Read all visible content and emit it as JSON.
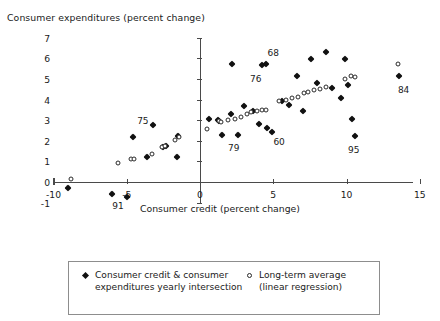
{
  "chart_data": {
    "type": "scatter",
    "title": "Consumer expenditures (percent change)",
    "xlabel": "Consumer credit (percent change)",
    "ylabel": "Consumer expenditures (percent change)",
    "xlim": [
      -10,
      15
    ],
    "ylim": [
      -1,
      7
    ],
    "xticks": [
      -10,
      -5,
      0,
      5,
      10,
      15
    ],
    "xtick_labels": [
      "-10",
      "-5",
      "0",
      "5",
      "10",
      "15"
    ],
    "yticks": [
      -1,
      0,
      1,
      2,
      3,
      4,
      5,
      6,
      7
    ],
    "ytick_labels": [
      "-1",
      "0",
      "1",
      "2",
      "3",
      "4",
      "5",
      "6",
      "7"
    ],
    "grid": false,
    "legend_position": "bottom",
    "series": [
      {
        "name": "Consumer credit & consumer expenditures yearly intersection",
        "marker": "filled-diamond",
        "color": "#111111",
        "points": [
          [
            -9.0,
            -0.3
          ],
          [
            -6.0,
            -0.6
          ],
          [
            -5.0,
            -0.75
          ],
          [
            -4.6,
            2.2
          ],
          [
            -3.2,
            2.75
          ],
          [
            -3.6,
            1.2
          ],
          [
            -2.5,
            1.7
          ],
          [
            -2.3,
            1.75
          ],
          [
            -1.5,
            2.25
          ],
          [
            -1.6,
            1.2
          ],
          [
            0.6,
            3.05
          ],
          [
            1.2,
            3.0
          ],
          [
            1.3,
            2.95
          ],
          [
            1.5,
            2.3
          ],
          [
            2.1,
            3.3
          ],
          [
            2.2,
            5.75
          ],
          [
            2.6,
            2.3
          ],
          [
            3.0,
            3.7
          ],
          [
            3.6,
            3.45
          ],
          [
            4.2,
            5.7
          ],
          [
            4.5,
            5.75
          ],
          [
            4.0,
            2.8
          ],
          [
            4.6,
            2.6
          ],
          [
            4.9,
            2.45
          ],
          [
            5.6,
            3.95
          ],
          [
            6.1,
            3.75
          ],
          [
            6.6,
            5.15
          ],
          [
            7.0,
            3.45
          ],
          [
            7.6,
            5.95
          ],
          [
            8.0,
            4.8
          ],
          [
            8.6,
            6.3
          ],
          [
            9.0,
            4.55
          ],
          [
            9.6,
            4.1
          ],
          [
            9.9,
            5.95
          ],
          [
            10.1,
            4.7
          ],
          [
            10.4,
            3.05
          ],
          [
            10.6,
            2.25
          ],
          [
            13.6,
            5.15
          ]
        ]
      },
      {
        "name": "Long-term average (linear regression)",
        "marker": "open-circle",
        "color": "#2a2a2a",
        "points": [
          [
            -8.8,
            0.15
          ],
          [
            -5.6,
            0.9
          ],
          [
            -4.7,
            1.1
          ],
          [
            -4.5,
            1.1
          ],
          [
            -3.3,
            1.35
          ],
          [
            -2.6,
            1.7
          ],
          [
            -2.4,
            1.75
          ],
          [
            -1.7,
            2.05
          ],
          [
            -1.4,
            2.2
          ],
          [
            0.5,
            2.55
          ],
          [
            1.3,
            2.95
          ],
          [
            1.4,
            2.9
          ],
          [
            1.9,
            3.0
          ],
          [
            2.4,
            3.05
          ],
          [
            2.8,
            3.15
          ],
          [
            3.2,
            3.3
          ],
          [
            3.5,
            3.4
          ],
          [
            3.9,
            3.45
          ],
          [
            4.2,
            3.5
          ],
          [
            4.5,
            3.5
          ],
          [
            5.4,
            3.95
          ],
          [
            5.9,
            4.0
          ],
          [
            6.3,
            4.1
          ],
          [
            6.7,
            4.15
          ],
          [
            7.1,
            4.3
          ],
          [
            7.4,
            4.35
          ],
          [
            7.8,
            4.45
          ],
          [
            8.2,
            4.5
          ],
          [
            8.6,
            4.6
          ],
          [
            9.9,
            5.0
          ],
          [
            10.3,
            5.15
          ],
          [
            10.6,
            5.1
          ],
          [
            13.5,
            5.75
          ]
        ]
      }
    ],
    "annotations": [
      {
        "text": "75",
        "x": -3.9,
        "y": 2.95
      },
      {
        "text": "91",
        "x": -5.6,
        "y": -1.15
      },
      {
        "text": "79",
        "x": 2.3,
        "y": 1.65
      },
      {
        "text": "60",
        "x": 5.4,
        "y": 1.95
      },
      {
        "text": "68",
        "x": 5.0,
        "y": 6.25
      },
      {
        "text": "76",
        "x": 3.8,
        "y": 5.0
      },
      {
        "text": "95",
        "x": 10.5,
        "y": 1.55
      },
      {
        "text": "84",
        "x": 13.9,
        "y": 4.45
      }
    ]
  },
  "legend": {
    "items": [
      {
        "marker": "filled-diamond",
        "label": "Consumer credit & consumer expenditures yearly intersection"
      },
      {
        "marker": "open-circle",
        "label": "Long-term average (linear regression)"
      }
    ]
  }
}
